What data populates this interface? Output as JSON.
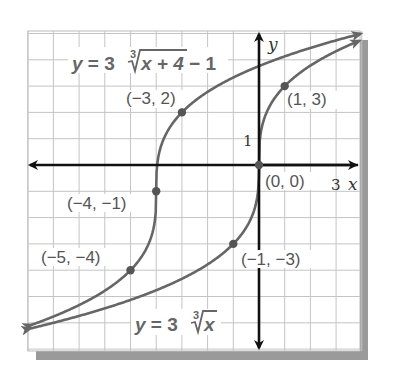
{
  "chart_data": {
    "type": "line",
    "title": "",
    "xlabel": "x",
    "ylabel": "y",
    "xlim": [
      -9,
      4
    ],
    "ylim": [
      -7,
      5
    ],
    "grid": true,
    "tick_labels": {
      "x": [
        "3"
      ],
      "y": [
        "1"
      ]
    },
    "series": [
      {
        "name": "y = 3∛(x + 4) − 1",
        "label_parts": {
          "lhs": "y",
          "eq": " = 3",
          "index": "3",
          "radicand": "x + 4",
          "tail": " − 1"
        },
        "color": "#666666",
        "points": [
          {
            "x": -3,
            "y": 2,
            "label": "(−3, 2)"
          },
          {
            "x": -4,
            "y": -1,
            "label": "(−4, −1)"
          },
          {
            "x": -5,
            "y": -4,
            "label": "(−5, −4)"
          }
        ]
      },
      {
        "name": "y = 3∛x",
        "label_parts": {
          "lhs": "y",
          "eq": " = 3",
          "index": "3",
          "radicand": "x",
          "tail": ""
        },
        "color": "#666666",
        "points": [
          {
            "x": 1,
            "y": 3,
            "label": "(1, 3)"
          },
          {
            "x": 0,
            "y": 0,
            "label": "(0, 0)"
          },
          {
            "x": -1,
            "y": -3,
            "label": "(−1, −3)"
          }
        ]
      }
    ]
  },
  "labels": {
    "y_axis": "y",
    "x_axis": "x",
    "x_tick": "3",
    "y_tick": "1",
    "p_m3_2": "(−3, 2)",
    "p_1_3": "(1, 3)",
    "p_0_0": "(0, 0)",
    "p_m4_m1": "(−4, −1)",
    "p_m5_m4": "(−5, −4)",
    "p_m1_m3": "(−1, −3)",
    "eq1_lhs": "y",
    "eq1_mid": " = 3",
    "eq1_index": "3",
    "eq1_rad": "x + 4",
    "eq1_tail": " − 1",
    "eq2_lhs": "y",
    "eq2_mid": " = 3",
    "eq2_index": "3",
    "eq2_rad": "x"
  }
}
